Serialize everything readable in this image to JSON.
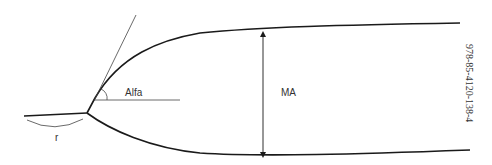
{
  "diagram": {
    "labels": {
      "angle": "Alfa",
      "radius": "r",
      "dimension": "MA"
    },
    "isbn": "978-85-4120-138-4",
    "colors": {
      "stroke": "#1a1a1a",
      "thin_stroke": "#444444",
      "text": "#333333",
      "background": "#ffffff"
    }
  }
}
